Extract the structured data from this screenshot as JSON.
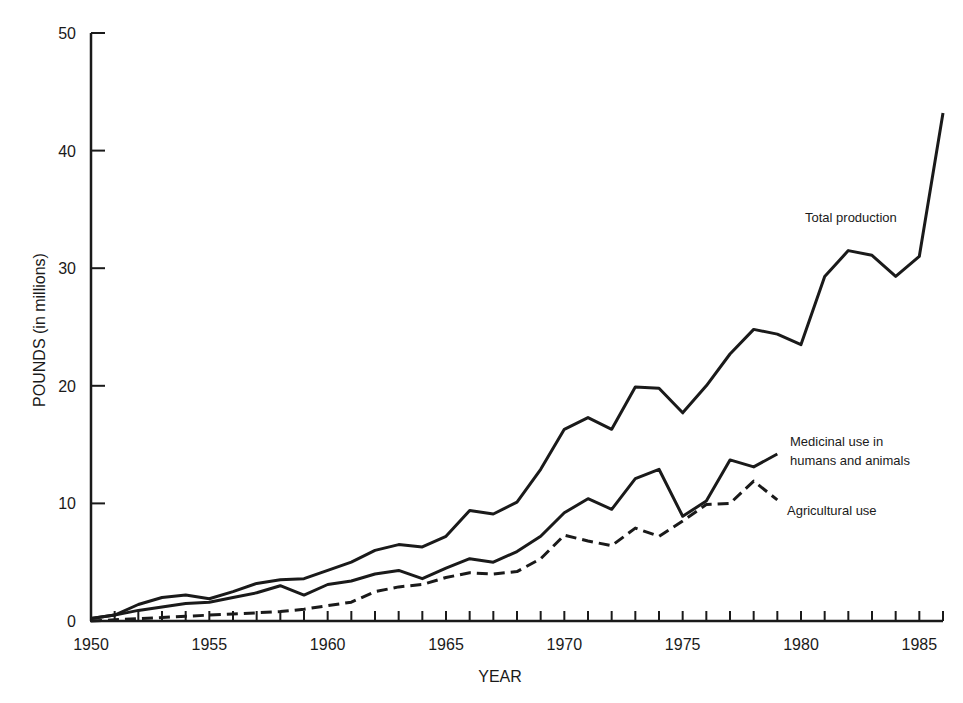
{
  "chart_data": {
    "type": "line",
    "title": "",
    "xlabel": "YEAR",
    "ylabel": "POUNDS (in millions)",
    "xlim": [
      1950,
      1986
    ],
    "ylim": [
      0,
      50
    ],
    "grid": false,
    "legend": "inline annotations",
    "x_tick_labels": [
      "1950",
      "1955",
      "1960",
      "1965",
      "1970",
      "1975",
      "1980",
      "1985"
    ],
    "y_tick_labels": [
      "0",
      "10",
      "20",
      "30",
      "40",
      "50"
    ],
    "series": [
      {
        "name": "Total production",
        "style": "solid",
        "x": [
          1950,
          1951,
          1952,
          1953,
          1954,
          1955,
          1956,
          1957,
          1958,
          1959,
          1960,
          1961,
          1962,
          1963,
          1964,
          1965,
          1966,
          1967,
          1968,
          1969,
          1970,
          1971,
          1972,
          1973,
          1974,
          1975,
          1976,
          1977,
          1978,
          1979,
          1980,
          1981,
          1982,
          1983,
          1984,
          1985,
          1986
        ],
        "values": [
          0.2,
          0.5,
          1.4,
          2.0,
          2.2,
          1.9,
          2.5,
          3.2,
          3.5,
          3.6,
          4.3,
          5.0,
          6.0,
          6.5,
          6.3,
          7.2,
          9.4,
          9.1,
          10.1,
          12.9,
          16.3,
          17.3,
          16.3,
          19.9,
          19.8,
          17.7,
          20.0,
          22.7,
          24.8,
          24.4,
          23.5,
          29.3,
          31.5,
          31.1,
          29.3,
          31.0,
          43.2
        ]
      },
      {
        "name": "Medicinal use in humans and animals",
        "style": "solid",
        "x": [
          1950,
          1951,
          1952,
          1953,
          1954,
          1955,
          1956,
          1957,
          1958,
          1959,
          1960,
          1961,
          1962,
          1963,
          1964,
          1965,
          1966,
          1967,
          1968,
          1969,
          1970,
          1971,
          1972,
          1973,
          1974,
          1975,
          1976,
          1977,
          1978,
          1979
        ],
        "values": [
          0.2,
          0.5,
          0.9,
          1.2,
          1.5,
          1.6,
          2.0,
          2.4,
          3.0,
          2.2,
          3.1,
          3.4,
          4.0,
          4.3,
          3.6,
          4.5,
          5.3,
          5.0,
          5.9,
          7.2,
          9.2,
          10.4,
          9.5,
          12.1,
          12.9,
          8.9,
          10.2,
          13.7,
          13.1,
          14.2
        ]
      },
      {
        "name": "Agricultural use",
        "style": "dashed",
        "x": [
          1950,
          1951,
          1952,
          1953,
          1954,
          1955,
          1956,
          1957,
          1958,
          1959,
          1960,
          1961,
          1962,
          1963,
          1964,
          1965,
          1966,
          1967,
          1968,
          1969,
          1970,
          1971,
          1972,
          1973,
          1974,
          1975,
          1976,
          1977,
          1978,
          1979
        ],
        "values": [
          0.0,
          0.1,
          0.2,
          0.3,
          0.4,
          0.5,
          0.6,
          0.7,
          0.8,
          1.0,
          1.3,
          1.6,
          2.5,
          2.9,
          3.1,
          3.7,
          4.1,
          4.0,
          4.2,
          5.3,
          7.3,
          6.8,
          6.4,
          7.9,
          7.2,
          8.5,
          9.9,
          10.0,
          11.9,
          10.3
        ]
      }
    ],
    "annotations": [
      {
        "text": "Total production",
        "series": 0
      },
      {
        "text": "Medicinal use in",
        "series": 1,
        "line": 1
      },
      {
        "text": "humans and animals",
        "series": 1,
        "line": 2
      },
      {
        "text": "Agricultural use",
        "series": 2
      }
    ]
  }
}
